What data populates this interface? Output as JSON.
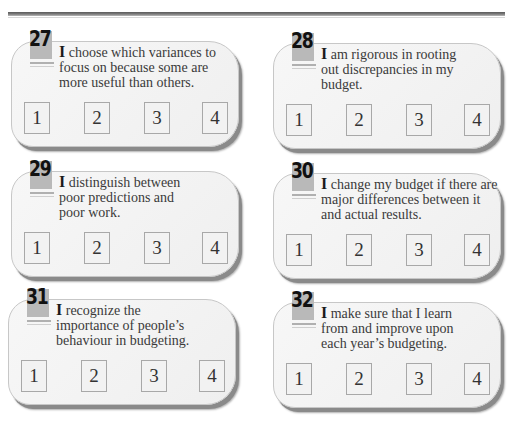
{
  "items": [
    {
      "number": "27",
      "cap": "I",
      "text": " choose which variances to focus on because some are more useful than others.",
      "options": [
        "1",
        "2",
        "3",
        "4"
      ]
    },
    {
      "number": "28",
      "cap": "I",
      "text": " am rigorous in rooting out discrepancies in my budget.",
      "options": [
        "1",
        "2",
        "3",
        "4"
      ]
    },
    {
      "number": "29",
      "cap": "I",
      "text": " distinguish between poor predictions and poor work.",
      "options": [
        "1",
        "2",
        "3",
        "4"
      ]
    },
    {
      "number": "30",
      "cap": "I",
      "text": " change my budget if there are major differences between it and actual results.",
      "options": [
        "1",
        "2",
        "3",
        "4"
      ]
    },
    {
      "number": "31",
      "cap": "I",
      "text": " recognize the importance of people’s behaviour in budgeting.",
      "options": [
        "1",
        "2",
        "3",
        "4"
      ]
    },
    {
      "number": "32",
      "cap": "I",
      "text": " make sure that I learn from and improve upon each year’s budgeting.",
      "options": [
        "1",
        "2",
        "3",
        "4"
      ]
    }
  ],
  "colors": {
    "badge": "#b9b9b9",
    "card": "#f2f2f2",
    "shadow": "#8a8a8a",
    "rule": "#6a6a6a"
  }
}
